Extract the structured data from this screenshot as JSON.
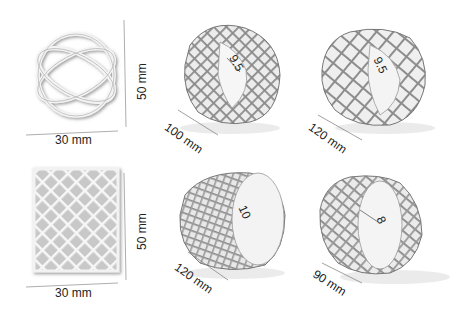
{
  "figure": {
    "rows": [
      {
        "flat": {
          "width_label": "30 mm",
          "height_label": "50 mm",
          "pattern": "sparse-lissajous"
        },
        "rolled": [
          {
            "length_label": "100 mm",
            "diameter_label": "9.5"
          },
          {
            "length_label": "120 mm",
            "diameter_label": "9.5"
          }
        ]
      },
      {
        "flat": {
          "width_label": "30 mm",
          "height_label": "50 mm",
          "pattern": "dense-diamond-mesh"
        },
        "rolled": [
          {
            "length_label": "120 mm",
            "diameter_label": "10"
          },
          {
            "length_label": "90 mm",
            "diameter_label": "8"
          }
        ]
      }
    ]
  }
}
